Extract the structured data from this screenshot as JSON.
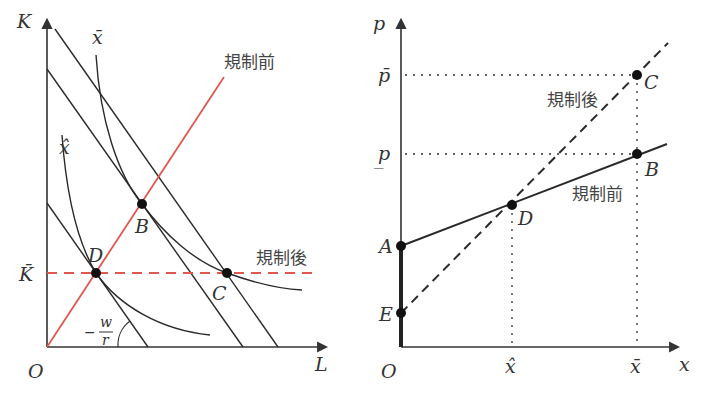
{
  "colors": {
    "axis": "#333333",
    "curve": "#2a2a2a",
    "red": "#e0574f",
    "dot": "#111111",
    "text": "#333333"
  },
  "left_panel": {
    "y_axis_label": "K",
    "x_axis_label": "L",
    "origin_label": "O",
    "kbar_label": "K̄",
    "isoquant_high_label": "x̄",
    "isoquant_low_label": "x̂",
    "slope_label_sign": "−",
    "slope_label_num": "w",
    "slope_label_den": "r",
    "red_solid_label": "規制前",
    "red_dashed_label": "規制後",
    "points": {
      "B": "B",
      "C": "C",
      "D": "D"
    }
  },
  "right_panel": {
    "y_axis_label": "p",
    "x_axis_label": "x",
    "origin_label": "O",
    "pbar_label": "p̄",
    "punder_label": "p̲",
    "xhat_label": "x̂",
    "xbar_label": "x̄",
    "dashed_line_label": "規制後",
    "solid_line_label": "規制前",
    "points": {
      "A": "A",
      "B": "B",
      "C": "C",
      "D": "D",
      "E": "E"
    }
  }
}
